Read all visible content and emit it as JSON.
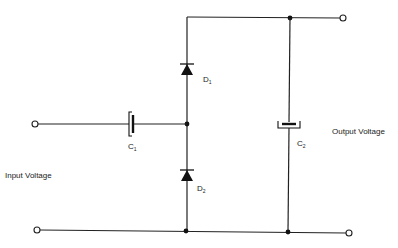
{
  "diagram": {
    "labels": {
      "input": "Input Voltage",
      "output": "Output Voltage",
      "d1_main": "D",
      "d1_sub": "1",
      "d2_main": "D",
      "d2_sub": "2",
      "c1_main": "C",
      "c1_sub": "1",
      "c2_main": "C",
      "c2_sub": "2"
    },
    "components": [
      {
        "id": "C1",
        "type": "capacitor",
        "orientation": "series, horizontal input"
      },
      {
        "id": "D1",
        "type": "diode",
        "orientation": "vertical, anode below, cathode toward top rail"
      },
      {
        "id": "D2",
        "type": "diode",
        "orientation": "vertical, anode on bottom rail, cathode toward middle node"
      },
      {
        "id": "C2",
        "type": "capacitor",
        "orientation": "vertical, between top and bottom rails"
      }
    ],
    "terminals": [
      "input-top",
      "input-bottom",
      "output-top",
      "output-bottom"
    ],
    "colors": {
      "line": "#222222",
      "background": "#ffffff"
    }
  }
}
